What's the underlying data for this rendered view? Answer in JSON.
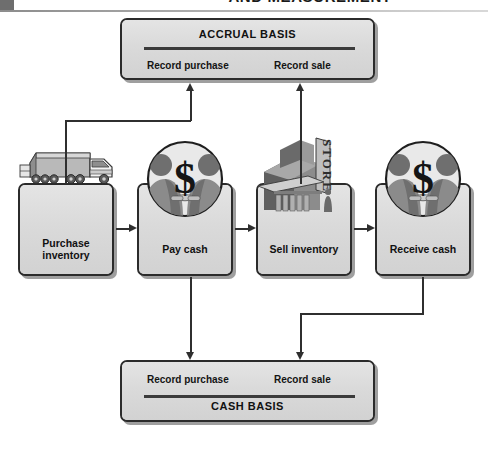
{
  "header": {
    "title": "AND MEASUREMENT",
    "corner_mark": "page-corner-block"
  },
  "diagram": {
    "accrual": {
      "title": "ACCRUAL BASIS",
      "left_label": "Record purchase",
      "right_label": "Record sale"
    },
    "cash": {
      "title": "CASH BASIS",
      "left_label": "Record purchase",
      "right_label": "Record sale"
    },
    "steps": [
      {
        "id": "purchase",
        "label": "Purchase\ninventory",
        "line1": "Purchase",
        "line2": "inventory",
        "art": "delivery-truck"
      },
      {
        "id": "paycash",
        "label": "Pay cash",
        "line1": "Pay cash",
        "line2": "",
        "art": "handshake-dollar"
      },
      {
        "id": "sell",
        "label": "Sell inventory",
        "line1": "Sell inventory",
        "line2": "",
        "art": "store-building"
      },
      {
        "id": "receive",
        "label": "Receive cash",
        "line1": "Receive cash",
        "line2": "",
        "art": "handshake-dollar"
      }
    ],
    "store_sign": "STORE",
    "currency_glyph": "$",
    "flow_arrows": [
      {
        "from": "purchase",
        "to": "paycash",
        "direction": "right"
      },
      {
        "from": "paycash",
        "to": "sell",
        "direction": "right"
      },
      {
        "from": "sell",
        "to": "receive",
        "direction": "right"
      },
      {
        "from": "purchase",
        "to": "accrual-record-purchase",
        "direction": "up"
      },
      {
        "from": "sell",
        "to": "accrual-record-sale",
        "direction": "up"
      },
      {
        "from": "paycash",
        "to": "cash-record-purchase",
        "direction": "down"
      },
      {
        "from": "receive",
        "to": "cash-record-sale",
        "direction": "down"
      }
    ]
  },
  "colors": {
    "panel_fill": "#dcdcdc",
    "panel_border": "#2b2b2b",
    "wire": "#2f2f2f",
    "art_dark": "#5a5a5a",
    "art_mid": "#8f8f8f",
    "art_light": "#cfcfcf",
    "text": "#111111"
  }
}
